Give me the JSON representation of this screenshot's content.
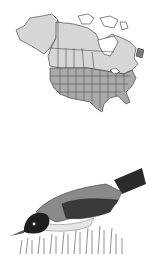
{
  "range_map": {
    "subject": "North America range map",
    "colors": {
      "year_round": "#a9a9a9",
      "breeding": "#d6d6d6",
      "absent": "#ffffff",
      "outline": "#333333"
    }
  },
  "illustration": {
    "subject": "bird foraging in grass"
  },
  "caption": {
    "text": ""
  }
}
